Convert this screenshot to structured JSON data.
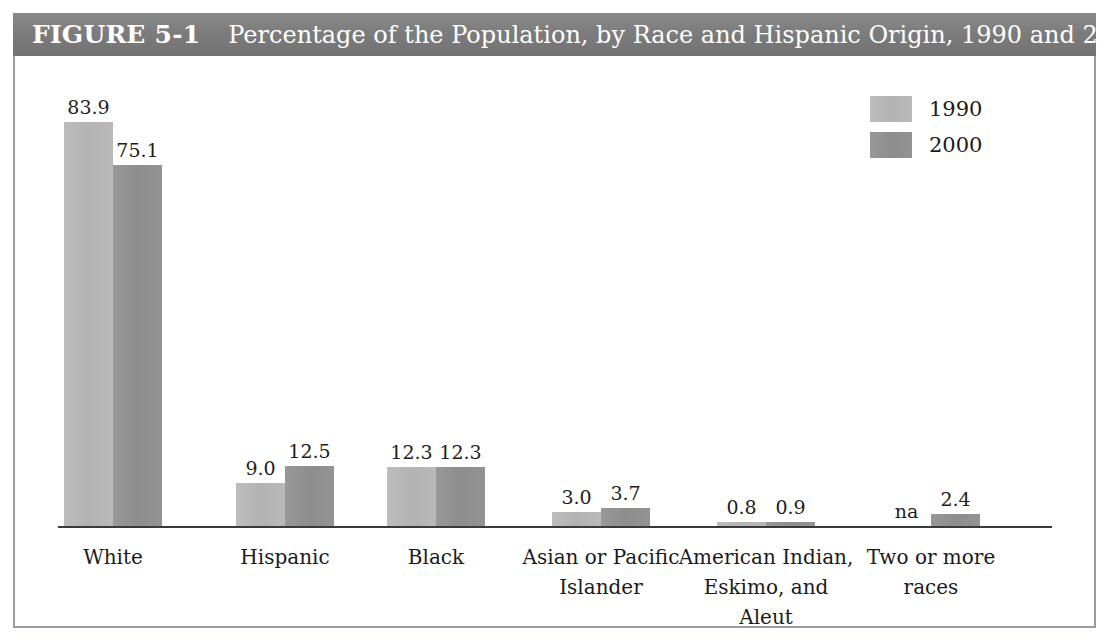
{
  "figure": {
    "label": "FIGURE 5-1",
    "caption": "Percentage of the Population, by Race and Hispanic Origin, 1990 and 2000"
  },
  "legend": {
    "items": [
      {
        "label": "1990",
        "color": "#b5b5b5"
      },
      {
        "label": "2000",
        "color": "#8e8e8e"
      }
    ]
  },
  "chart_data": {
    "type": "bar",
    "title": "Percentage of the Population, by Race and Hispanic Origin, 1990 and 2000",
    "xlabel": "",
    "ylabel": "",
    "ylim": [
      0,
      90
    ],
    "grid": false,
    "legend_position": "top-right",
    "categories": [
      "White",
      "Hispanic",
      "Black",
      "Asian or Pacific Islander",
      "American Indian, Eskimo, and Aleut",
      "Two or more races"
    ],
    "category_lines": [
      [
        "White"
      ],
      [
        "Hispanic"
      ],
      [
        "Black"
      ],
      [
        "Asian or Pacific",
        "Islander"
      ],
      [
        "American Indian,",
        "Eskimo, and Aleut"
      ],
      [
        "Two or more",
        "races"
      ]
    ],
    "series": [
      {
        "name": "1990",
        "color": "#b5b5b5",
        "values": [
          83.9,
          9.0,
          12.3,
          3.0,
          0.8,
          null
        ],
        "labels": [
          "83.9",
          "9.0",
          "12.3",
          "3.0",
          "0.8",
          "na"
        ]
      },
      {
        "name": "2000",
        "color": "#8e8e8e",
        "values": [
          75.1,
          12.5,
          12.3,
          3.7,
          0.9,
          2.4
        ],
        "labels": [
          "75.1",
          "12.5",
          "12.3",
          "3.7",
          "0.9",
          "2.4"
        ]
      }
    ]
  },
  "geometry": {
    "px_per_unit": 4.81,
    "bar_width": 49,
    "group_left_positions": [
      49,
      221,
      372,
      537,
      702,
      867
    ]
  }
}
